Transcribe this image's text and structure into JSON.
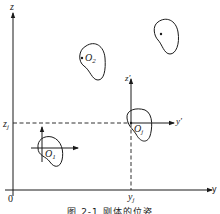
{
  "figure": {
    "caption": "图 2-1 刚体的位姿",
    "stroke_color": "#1a1a1a",
    "background": "#ffffff"
  },
  "axes": {
    "global": {
      "z_label": "z",
      "y_label": "y",
      "origin_label": "0"
    },
    "projection": {
      "z_label": "z",
      "z_subscript": "j",
      "y_label": "y",
      "y_subscript": "j"
    },
    "local_frame_j": {
      "z_label": "z′",
      "y_label": "y′"
    }
  },
  "bodies": [
    {
      "name": "body-1",
      "label": "O",
      "subscript": "1",
      "has_frame": true
    },
    {
      "name": "body-2",
      "label": "O",
      "subscript": "2",
      "has_frame": false
    },
    {
      "name": "body-j",
      "label": "O",
      "subscript": "j",
      "has_frame": true
    },
    {
      "name": "body-top-right",
      "label": "",
      "subscript": "",
      "has_frame": false
    }
  ]
}
